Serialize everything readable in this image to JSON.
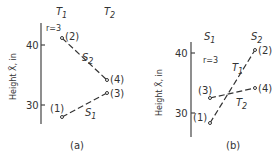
{
  "panels": [
    {
      "id": "a",
      "caption": "(a)",
      "y_axis_label": "Height X̄, in",
      "r_label": "r=3",
      "ticks": [
        {
          "label": "40",
          "value": 40
        },
        {
          "label": "30",
          "value": 30
        }
      ],
      "column_labels": [
        "T1",
        "T2"
      ],
      "column_label_main": [
        "T",
        "T"
      ],
      "column_label_sub": [
        "1",
        "2"
      ],
      "lines": [
        {
          "label_main": "S",
          "label_sub": "2",
          "from": "(2)",
          "to": "(4)"
        },
        {
          "label_main": "S",
          "label_sub": "1",
          "from": "(1)",
          "to": "(3)"
        }
      ],
      "points": [
        {
          "label": "(1)",
          "x": "T1",
          "y": 28
        },
        {
          "label": "(2)",
          "x": "T1",
          "y": 41
        },
        {
          "label": "(3)",
          "x": "T2",
          "y": 32
        },
        {
          "label": "(4)",
          "x": "T2",
          "y": 34
        }
      ]
    },
    {
      "id": "b",
      "caption": "(b)",
      "y_axis_label": "Height X̄, in",
      "r_label": "r=3",
      "ticks": [
        {
          "label": "40",
          "value": 40
        },
        {
          "label": "30",
          "value": 30
        }
      ],
      "column_labels": [
        "S1",
        "S2"
      ],
      "column_label_main": [
        "S",
        "S"
      ],
      "column_label_sub": [
        "1",
        "2"
      ],
      "lines": [
        {
          "label_main": "T",
          "label_sub": "1",
          "from": "(1)",
          "to": "(2)"
        },
        {
          "label_main": "T",
          "label_sub": "2",
          "from": "(3)",
          "to": "(4)"
        }
      ],
      "points": [
        {
          "label": "(1)",
          "x": "S1",
          "y": 28
        },
        {
          "label": "(2)",
          "x": "S2",
          "y": 41
        },
        {
          "label": "(3)",
          "x": "S1",
          "y": 32
        },
        {
          "label": "(4)",
          "x": "S2",
          "y": 34
        }
      ]
    }
  ]
}
